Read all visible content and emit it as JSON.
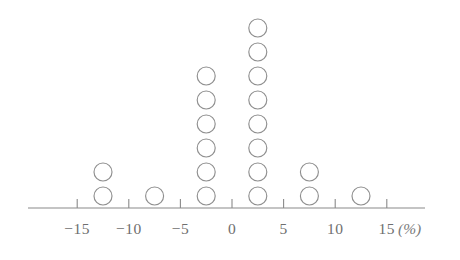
{
  "chart_data": {
    "type": "scatter",
    "plot_style": "dot-plot",
    "title": "",
    "subtitle": "",
    "xlabel": "(%)",
    "ylabel": "",
    "xlim": [
      -17.5,
      17.5
    ],
    "grid": false,
    "legend": null,
    "axis_unit_label": "(%)",
    "x_tick_values": [
      -15,
      -10,
      -5,
      0,
      5,
      10,
      15
    ],
    "x_tick_labels": [
      "−15",
      "−10",
      "−5",
      "0",
      "5",
      "10",
      "15"
    ],
    "bin_width": 5,
    "total_count": 20,
    "categories": [
      -12.5,
      -7.5,
      -2.5,
      2.5,
      7.5,
      12.5
    ],
    "values": [
      2,
      1,
      6,
      8,
      2,
      1
    ],
    "stacks": [
      {
        "x": -12.5,
        "count": 2,
        "label": "−12.5"
      },
      {
        "x": -7.5,
        "count": 1,
        "label": "−7.5"
      },
      {
        "x": -2.5,
        "count": 6,
        "label": "−2.5"
      },
      {
        "x": 2.5,
        "count": 8,
        "label": "2.5"
      },
      {
        "x": 7.5,
        "count": 2,
        "label": "7.5"
      },
      {
        "x": 12.5,
        "count": 1,
        "label": "12.5"
      }
    ]
  },
  "style": {
    "dot_stroke_color": "#8f8f8f",
    "axis_color": "#8a8a8a",
    "tick_label_color": "#6f6f6f",
    "unit_label_color": "#7a7a7a",
    "background_color": "#ffffff",
    "dot_radius_px": 9,
    "dot_spacing_px": 24
  },
  "geometry": {
    "axis_y": 208,
    "axis_x_start": 28,
    "axis_x_end": 425,
    "px_per_unit": 10.32,
    "origin_x": 232,
    "tick_height": 9,
    "baseline_dot_cy": 196,
    "tick_label_y": 234,
    "unit_label_x": 398,
    "unit_label_y": 234
  }
}
